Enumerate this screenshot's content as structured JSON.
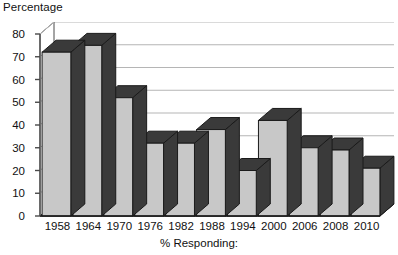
{
  "chart_data": {
    "type": "bar",
    "title": "",
    "ylabel": "Percentage",
    "xlabel": "% Responding:",
    "categories": [
      "1958",
      "1964",
      "1970",
      "1976",
      "1982",
      "1988",
      "1994",
      "2000",
      "2006",
      "2008",
      "2010"
    ],
    "values": [
      72,
      75,
      52,
      32,
      32,
      38,
      20,
      42,
      30,
      29,
      21
    ],
    "ylim": [
      0,
      80
    ],
    "ytick_step": 10,
    "yticks": [
      80,
      70,
      60,
      50,
      40,
      30,
      20,
      10,
      0
    ],
    "grid": "horizontal",
    "legend": "none",
    "style": "3d-column",
    "colors": {
      "bar_face": "#c8c8c8",
      "bar_shade": "#3a3a3a",
      "bar_outline": "#1a1a1a",
      "gridline": "#b5b5b5",
      "axis": "#4a4a4a",
      "plot_background": "#ffffff",
      "text": "#111111"
    }
  },
  "axis": {
    "y_title": "Percentage",
    "x_title": "% Responding:"
  }
}
